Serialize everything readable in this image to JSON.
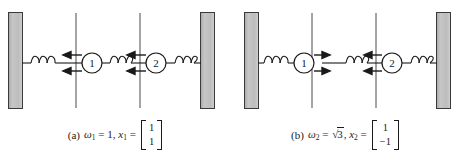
{
  "figure": {
    "background_color": "#ffffff",
    "wall_color": "#b8b8b8",
    "line_color": "#1a1a1a"
  },
  "panels": [
    {
      "id": "a",
      "caption": {
        "label": "(a)",
        "omega_symbol": "ω",
        "omega_sub": "1",
        "equals": "=",
        "omega_value": "1",
        "comma": ",",
        "x_symbol": "x",
        "x_sub": "1",
        "vector": [
          "1",
          "1"
        ]
      },
      "masses": [
        {
          "label": "1",
          "arrow_direction": "left",
          "arrow_count": 2
        },
        {
          "label": "2",
          "arrow_direction": "left",
          "arrow_count": 2
        }
      ],
      "springs": 3,
      "walls": 2,
      "reference_lines": 2
    },
    {
      "id": "b",
      "caption": {
        "label": "(b)",
        "omega_symbol": "ω",
        "omega_sub": "2",
        "equals": "=",
        "sqrt_symbol": "√",
        "omega_value": "3",
        "comma": ",",
        "x_symbol": "x",
        "x_sub": "2",
        "vector": [
          "1",
          "−1"
        ]
      },
      "masses": [
        {
          "label": "1",
          "arrow_direction": "right",
          "arrow_count": 2
        },
        {
          "label": "2",
          "arrow_direction": "left",
          "arrow_count": 2
        }
      ],
      "springs": 3,
      "walls": 2,
      "reference_lines": 2
    }
  ]
}
